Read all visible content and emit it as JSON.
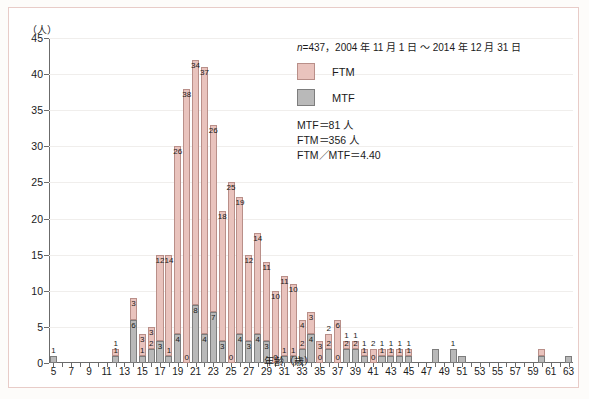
{
  "chart_data": {
    "type": "bar",
    "subtype": "stacked-histogram",
    "title": "",
    "xlabel": "年齢（歳）",
    "ylabel": "（人）",
    "ylim": [
      0,
      45
    ],
    "ytick_step": 5,
    "yticks": [
      0,
      5,
      10,
      15,
      20,
      25,
      30,
      35,
      40,
      45
    ],
    "xlim": [
      5,
      63
    ],
    "xticks": [
      5,
      7,
      9,
      11,
      13,
      15,
      17,
      19,
      21,
      23,
      25,
      27,
      29,
      31,
      33,
      35,
      37,
      39,
      41,
      43,
      45,
      47,
      49,
      51,
      53,
      55,
      57,
      59,
      61,
      63
    ],
    "grid": true,
    "legend_position": "top-right",
    "series": [
      {
        "name": "FTM",
        "color": "#e9c3bd"
      },
      {
        "name": "MTF",
        "color": "#b9b9b9"
      }
    ],
    "categories": [
      5,
      6,
      7,
      8,
      9,
      10,
      11,
      12,
      13,
      14,
      15,
      16,
      17,
      18,
      19,
      20,
      21,
      22,
      23,
      24,
      25,
      26,
      27,
      28,
      29,
      30,
      31,
      32,
      33,
      34,
      35,
      36,
      37,
      38,
      39,
      40,
      41,
      42,
      43,
      44,
      45,
      46,
      47,
      48,
      49,
      50,
      51,
      52,
      53,
      54,
      55,
      56,
      57,
      58,
      59,
      60,
      61,
      62,
      63
    ],
    "ftm": [
      0,
      0,
      0,
      0,
      0,
      0,
      0,
      1,
      0,
      3,
      3,
      3,
      12,
      14,
      26,
      38,
      34,
      37,
      26,
      18,
      25,
      19,
      12,
      14,
      11,
      10,
      11,
      10,
      4,
      3,
      3,
      2,
      6,
      1,
      1,
      1,
      2,
      1,
      1,
      1,
      1,
      0,
      0,
      0,
      0,
      0,
      0,
      0,
      0,
      0,
      0,
      0,
      0,
      0,
      0,
      1,
      0,
      0,
      0
    ],
    "mtf": [
      1,
      0,
      0,
      0,
      0,
      0,
      0,
      1,
      0,
      6,
      1,
      2,
      3,
      1,
      4,
      0,
      8,
      4,
      7,
      3,
      0,
      4,
      3,
      4,
      3,
      0,
      1,
      1,
      2,
      4,
      0,
      2,
      0,
      2,
      2,
      1,
      0,
      1,
      1,
      1,
      1,
      0,
      0,
      2,
      0,
      2,
      1,
      0,
      0,
      0,
      0,
      0,
      0,
      0,
      0,
      1,
      0,
      0,
      1
    ],
    "value_labels_ftm": {
      "12": "1",
      "14": "3",
      "15": "3",
      "16": "3",
      "17": "12",
      "18": "14",
      "19": "26",
      "20": "38",
      "21": "34",
      "22": "37",
      "23": "26",
      "24": "18",
      "25": "25",
      "26": "19",
      "27": "12",
      "28": "14",
      "29": "11",
      "30": "10",
      "31": "11",
      "32": "10",
      "33": "4",
      "34": "3",
      "35": "3",
      "36": "2",
      "37": "6",
      "38": "1",
      "39": "1",
      "40": "1",
      "41": "2",
      "42": "1",
      "43": "1",
      "44": "1",
      "45": "1",
      "59": "1"
    },
    "value_labels_mtf": {
      "5": "1",
      "12": "1",
      "14": "6",
      "15": "1",
      "16": "2",
      "17": "3",
      "18": "1",
      "19": "4",
      "20": "0",
      "21": "8",
      "22": "4",
      "23": "7",
      "24": "3",
      "25": "0",
      "26": "4",
      "27": "3",
      "28": "4",
      "29": "3",
      "30": "0",
      "31": "1",
      "32": "1",
      "33": "2",
      "34": "4",
      "35": "0",
      "36": "2",
      "37": "0",
      "38": "2",
      "39": "2",
      "40": "1",
      "41": "0",
      "42": "1",
      "43": "1",
      "44": "1",
      "45": "1",
      "47": "2",
      "49": "2",
      "50": "1",
      "59": "1",
      "62": "1"
    },
    "annotation_n": "n=437，2004 年 11 月 1 日 ～ 2014 年 12 月 31 日",
    "annotation_n_italic": "n",
    "annotation_n_rest": "=437，2004 年 11 月 1 日 ～ 2014 年 12 月 31 日",
    "stats": [
      "MTF＝81 人",
      "FTM＝356 人",
      "FTM／MTF＝4.40"
    ],
    "legend_labels": {
      "ftm": "FTM",
      "mtf": "MTF"
    }
  }
}
